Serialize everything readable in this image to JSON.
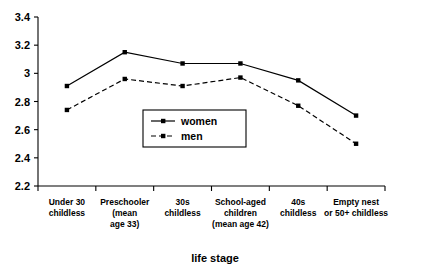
{
  "chart_data": {
    "type": "line",
    "title": "",
    "xlabel": "life stage",
    "ylabel": "",
    "ylim": [
      2.2,
      3.4
    ],
    "ytick_step": 0.2,
    "yticks": [
      "3.4",
      "3.2",
      "3",
      "2.8",
      "2.6",
      "2.4",
      "2.2"
    ],
    "grid": false,
    "legend_position": "center",
    "categories": [
      "Under 30 childless",
      "Preschooler (mean age 33)",
      "30s childless",
      "School-aged children (mean age 42)",
      "40s childless",
      "Empty nest or 50+ childless"
    ],
    "category_lines": [
      [
        "Under 30",
        "childless"
      ],
      [
        "Preschooler",
        "(mean",
        "age 33)"
      ],
      [
        "30s",
        "childless"
      ],
      [
        "School-aged",
        "children",
        "(mean age 42)"
      ],
      [
        "40s",
        "childless"
      ],
      [
        "Empty nest",
        "or 50+ childless"
      ]
    ],
    "series": [
      {
        "name": "women",
        "style": "solid",
        "values": [
          2.91,
          3.15,
          3.07,
          3.07,
          2.95,
          2.7
        ]
      },
      {
        "name": "men",
        "style": "dashed",
        "values": [
          2.74,
          2.96,
          2.91,
          2.97,
          2.77,
          2.5
        ]
      }
    ]
  },
  "legend": {
    "entries": [
      {
        "label": "women"
      },
      {
        "label": "men"
      }
    ]
  },
  "colors": {
    "line": "#000000",
    "background": "#ffffff",
    "text": "#000000"
  }
}
